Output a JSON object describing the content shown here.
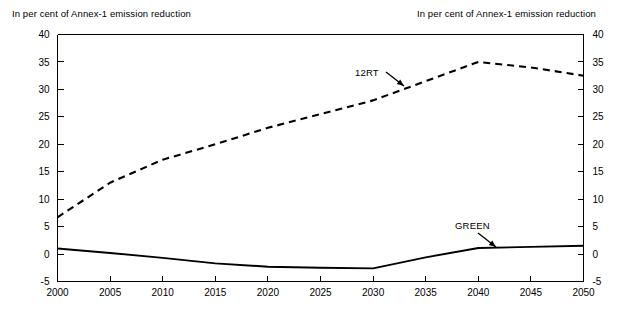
{
  "figure": {
    "width": 640,
    "height": 317,
    "background": "#ffffff",
    "header_left": "In per cent of Annex-1 emission reduction",
    "header_right": "In per cent of Annex-1 emission reduction"
  },
  "annotations": {
    "label_12rt": "12RT",
    "label_green": "GREEN"
  },
  "chart_data": {
    "type": "line",
    "title": "",
    "subtitle": "",
    "xlabel": "",
    "ylabel": "In per cent of Annex-1 emission reduction",
    "ylabel_right": "In per cent of Annex-1 emission reduction",
    "xlim": [
      2000,
      2050
    ],
    "ylim": [
      -5,
      40
    ],
    "xticks": [
      2000,
      2005,
      2010,
      2015,
      2020,
      2025,
      2030,
      2035,
      2040,
      2045,
      2050
    ],
    "yticks": [
      -5,
      0,
      5,
      10,
      15,
      20,
      25,
      30,
      35,
      40
    ],
    "xtick_labels": [
      "2000",
      "2005",
      "2010",
      "2015",
      "2020",
      "2025",
      "2030",
      "2035",
      "2040",
      "2045",
      "2050"
    ],
    "ytick_labels": [
      "-5",
      "0",
      "5",
      "10",
      "15",
      "20",
      "25",
      "30",
      "35",
      "40"
    ],
    "ytick_labels_right": [
      "-5",
      "0",
      "5",
      "10",
      "15",
      "20",
      "25",
      "30",
      "35",
      "40"
    ],
    "grid": false,
    "legend": "annotated-inline",
    "x": [
      2000,
      2005,
      2010,
      2015,
      2020,
      2025,
      2030,
      2035,
      2040,
      2045,
      2050
    ],
    "series": [
      {
        "name": "12RT",
        "style": "dashed",
        "color": "#000000",
        "values": [
          6.7,
          13.0,
          17.2,
          20.0,
          23.0,
          25.5,
          28.0,
          31.5,
          35.0,
          34.0,
          32.5
        ]
      },
      {
        "name": "GREEN",
        "style": "solid",
        "color": "#000000",
        "values": [
          1.0,
          0.2,
          -0.7,
          -1.7,
          -2.3,
          -2.5,
          -2.6,
          -0.6,
          1.1,
          1.3,
          1.5
        ]
      }
    ]
  },
  "axes": {
    "color": "#000000",
    "tick_direction": "inward"
  }
}
